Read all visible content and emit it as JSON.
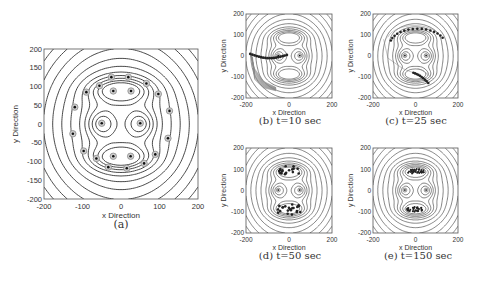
{
  "chart_data": [
    {
      "id": "a",
      "type": "scatter",
      "subtype": "contour-with-markers",
      "caption": "(a)",
      "xlabel": "x Direction",
      "ylabel": "y Direction",
      "xlim": [
        -200,
        200
      ],
      "ylim": [
        -200,
        200
      ],
      "xticks": [
        -200,
        -100,
        0,
        100,
        200
      ],
      "yticks": [
        200,
        150,
        100,
        50,
        0,
        -50,
        -100,
        -150,
        -200
      ],
      "grid": false,
      "markers_description": "circled dots at agent/target positions",
      "points": [
        [
          -25,
          125
        ],
        [
          19,
          125
        ],
        [
          66,
          108
        ],
        [
          97,
          80
        ],
        [
          126,
          35
        ],
        [
          122,
          -38
        ],
        [
          89,
          -81
        ],
        [
          60,
          -105
        ],
        [
          15,
          -118
        ],
        [
          -33,
          -115
        ],
        [
          -64,
          -92
        ],
        [
          -97,
          -72
        ],
        [
          -125,
          -26
        ],
        [
          -120,
          45
        ],
        [
          -90,
          85
        ],
        [
          -56,
          102
        ],
        [
          -20,
          88
        ],
        [
          26,
          88
        ],
        [
          -50,
          2
        ],
        [
          50,
          2
        ],
        [
          -20,
          -86
        ],
        [
          25,
          -86
        ]
      ]
    },
    {
      "id": "b",
      "type": "scatter",
      "subtype": "contour-with-trajectories",
      "caption": "(b)  t=10 sec",
      "xlabel": "x Direction",
      "ylabel": "y Direction",
      "xlim": [
        -200,
        200
      ],
      "ylim": [
        -200,
        200
      ],
      "xticks": [
        -200,
        0,
        200
      ],
      "yticks": [
        200,
        100,
        0,
        -100,
        -200
      ],
      "cluster": "agents spread along lower-left arc from (-180,10) to (-10,-10), trails down to (-50,-160)"
    },
    {
      "id": "c",
      "type": "scatter",
      "subtype": "contour-with-trajectories",
      "caption": "(c)  t=25 sec",
      "xlabel": "x Direction",
      "ylabel": "y Direction",
      "xlim": [
        -200,
        200
      ],
      "ylim": [
        -200,
        200
      ],
      "xticks": [
        -200,
        0,
        200
      ],
      "yticks": [
        200,
        100,
        0,
        -100,
        -200
      ],
      "cluster": "two groups: upper arc from (-90,60) to (150,60) via (20,130); lower arc (-20,-80) to (60,-130)"
    },
    {
      "id": "d",
      "type": "scatter",
      "subtype": "contour-with-trajectories",
      "caption": "(d)  t=50 sec",
      "xlabel": "x Direction",
      "ylabel": "y Direction",
      "xlim": [
        -200,
        200
      ],
      "ylim": [
        -200,
        200
      ],
      "xticks": [
        -200,
        0,
        200
      ],
      "yticks": [
        200,
        100,
        0,
        -100,
        -200
      ],
      "cluster": "agents inside upper and lower basins around y=+90 and y=-90"
    },
    {
      "id": "e",
      "type": "scatter",
      "subtype": "contour-with-trajectories",
      "caption": "(e)  t=150 sec",
      "xlabel": "x Direction",
      "ylabel": "y Direction",
      "xlim": [
        -200,
        200
      ],
      "ylim": [
        -200,
        200
      ],
      "xticks": [
        -200,
        0,
        200
      ],
      "yticks": [
        200,
        100,
        0,
        -100,
        -200
      ],
      "cluster": "agents converged into tight ellipses at (0,90) and (0,-90)"
    }
  ],
  "panels": {
    "a": {
      "caption": "(a)",
      "xlabel": "x Direction",
      "ylabel": "y Direction",
      "xticks": [
        "-200",
        "-100",
        "0",
        "100",
        "200"
      ],
      "yticks": [
        "200",
        "150",
        "100",
        "50",
        "0",
        "-50",
        "-100",
        "-150",
        "-200"
      ]
    },
    "b": {
      "caption": "(b)  t=10 sec",
      "xlabel": "x Direction",
      "ylabel": "y Direction",
      "xticks": [
        "-200",
        "0",
        "200"
      ],
      "yticks": [
        "200",
        "100",
        "0",
        "-100",
        "-200"
      ]
    },
    "c": {
      "caption": "(c)  t=25 sec",
      "xlabel": "x Direction",
      "ylabel": "y Direction",
      "xticks": [
        "-200",
        "0",
        "200"
      ],
      "yticks": [
        "200",
        "100",
        "0",
        "-100",
        "-200"
      ]
    },
    "d": {
      "caption": "(d)  t=50 sec",
      "xlabel": "x Direction",
      "ylabel": "y Direction",
      "xticks": [
        "-200",
        "0",
        "200"
      ],
      "yticks": [
        "200",
        "100",
        "0",
        "-100",
        "-200"
      ]
    },
    "e": {
      "caption": "(e)  t=150 sec",
      "xlabel": "x Direction",
      "ylabel": "y Direction",
      "xticks": [
        "-200",
        "0",
        "200"
      ],
      "yticks": [
        "200",
        "100",
        "0",
        "-100",
        "-200"
      ]
    }
  },
  "colors": {
    "line": "#333333",
    "axis": "#555555",
    "marker_ring": "#8a8a8a",
    "marker_dot": "#111111",
    "trail": "#888888"
  }
}
